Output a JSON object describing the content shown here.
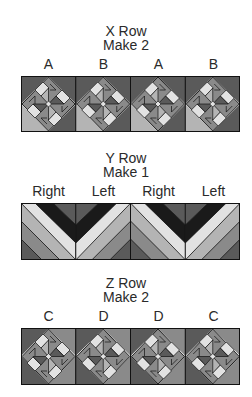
{
  "rows": [
    {
      "id": "x",
      "title": "X Row",
      "subtitle": "Make 2",
      "labels": [
        "A",
        "B",
        "A",
        "B"
      ],
      "block_type": "pinwheel"
    },
    {
      "id": "y",
      "title": "Y Row",
      "subtitle": "Make 1",
      "labels": [
        "Right",
        "Left",
        "Right",
        "Left"
      ],
      "block_type": "chevron"
    },
    {
      "id": "z",
      "title": "Z Row",
      "subtitle": "Make 2",
      "labels": [
        "C",
        "D",
        "D",
        "C"
      ],
      "block_type": "pinwheel"
    }
  ],
  "colors": {
    "black": "#1a1a1a",
    "dark": "#5a5a5a",
    "mid": "#8a8a8a",
    "light": "#b4b4b4",
    "pale": "#e2e2e2",
    "line": "#111111"
  }
}
